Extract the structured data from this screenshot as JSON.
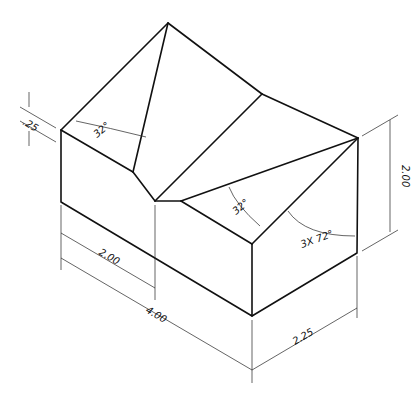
{
  "drawing": {
    "type": "isometric technical drawing",
    "top_caption": "",
    "dimensions": {
      "thickness": ".25",
      "left_angle": "32°",
      "right_angle": "32°",
      "repeat_angle": "3X 72°",
      "height": "2.00",
      "half_length": "2.00",
      "length": "4.00",
      "depth": "2.25"
    }
  }
}
